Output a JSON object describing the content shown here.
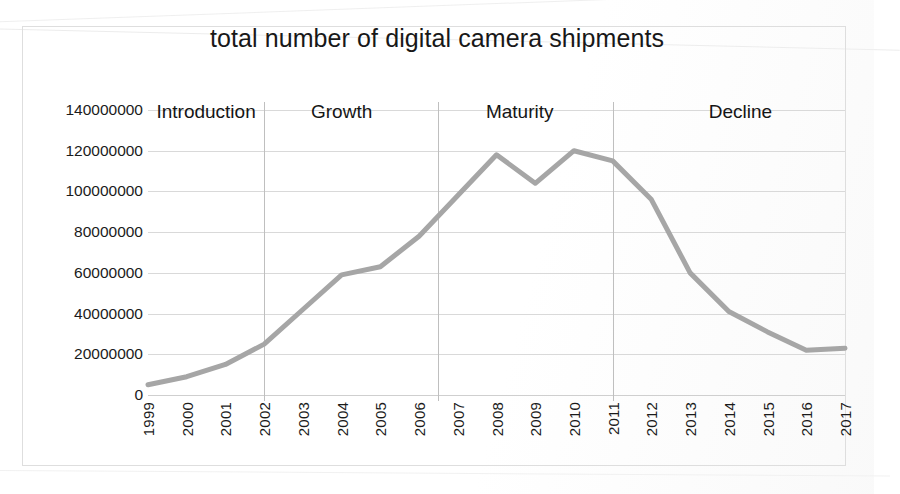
{
  "chart_data": {
    "type": "line",
    "title": "total number of digital camera shipments",
    "xlabel": "",
    "ylabel": "",
    "x": [
      1999,
      2000,
      2001,
      2002,
      2003,
      2004,
      2005,
      2006,
      2007,
      2008,
      2009,
      2010,
      2011,
      2012,
      2013,
      2014,
      2015,
      2016,
      2017
    ],
    "categories": [
      "1999",
      "2000",
      "2001",
      "2002",
      "2003",
      "2004",
      "2005",
      "2006",
      "2007",
      "2008",
      "2009",
      "2010",
      "2011",
      "2012",
      "2013",
      "2014",
      "2015",
      "2016",
      "2017"
    ],
    "series": [
      {
        "name": "total number of digital camera shipments",
        "color": "#a6a6a6",
        "values": [
          5000000,
          9000000,
          15000000,
          25000000,
          42000000,
          59000000,
          63000000,
          78000000,
          98000000,
          118000000,
          104000000,
          120000000,
          115000000,
          96000000,
          60000000,
          41000000,
          31000000,
          22000000,
          23000000
        ]
      }
    ],
    "ylim": [
      0,
      140000000
    ],
    "yticks": [
      0,
      20000000,
      40000000,
      60000000,
      80000000,
      100000000,
      120000000,
      140000000
    ],
    "ytick_labels": [
      "0",
      "20000000",
      "40000000",
      "60000000",
      "80000000",
      "100000000",
      "120000000",
      "140000000"
    ],
    "grid": true,
    "legend": "none",
    "annotations": [
      {
        "label": "Introduction",
        "span_start": 1999,
        "span_end": 2002,
        "center": 2000.5
      },
      {
        "label": "Growth",
        "span_start": 2002,
        "span_end": 2006.5,
        "center": 2004.0
      },
      {
        "label": "Maturity",
        "span_start": 2006.5,
        "span_end": 2011,
        "center": 2008.6
      },
      {
        "label": "Decline",
        "span_start": 2011,
        "span_end": 2017,
        "center": 2014.3
      }
    ],
    "phase_dividers": [
      2002,
      2006.5,
      2011
    ]
  },
  "chart": {
    "title": "total number of digital camera shipments",
    "line_color": "#a6a6a6",
    "grid_color": "#d9d9d9",
    "border_color": "#dedede"
  }
}
